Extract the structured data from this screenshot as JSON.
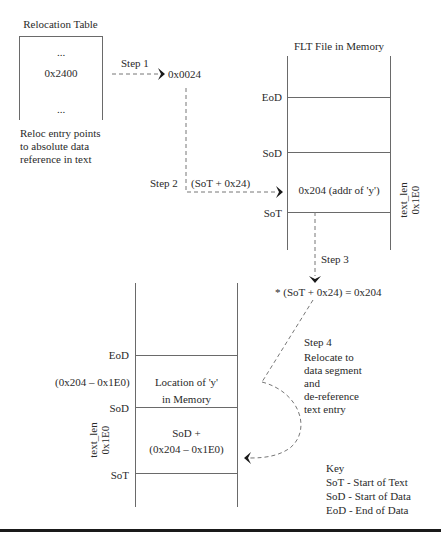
{
  "relocation_table": {
    "title": "Relocation Table",
    "entries": [
      "...",
      "0x2400",
      "..."
    ],
    "caption_lines": [
      "Reloc entry points",
      "to absolute data",
      "reference in text"
    ]
  },
  "steps": {
    "step1": {
      "label": "Step 1",
      "target": "0x0024"
    },
    "step2": {
      "label": "Step 2",
      "expr": "(SoT + 0x24)"
    },
    "step3": {
      "label": "Step 3",
      "result": "* (SoT + 0x24) = 0x204"
    },
    "step4": {
      "label": "Step 4",
      "desc_lines": [
        "Relocate to",
        "data segment",
        "and",
        "de-reference",
        "text entry"
      ]
    }
  },
  "flt_file": {
    "title": "FLT File in Memory",
    "markers": {
      "eod": "EoD",
      "sod": "SoD",
      "sot": "SoT"
    },
    "text_entry": "0x204 (addr of 'y')",
    "side_label_lines": [
      "text_len",
      "0x1E0"
    ]
  },
  "memory": {
    "markers": {
      "eod": "EoD",
      "sod": "SoD",
      "sot": "SoT"
    },
    "offset_label": "(0x204 – 0x1E0)",
    "data_cell_lines": [
      "Location of 'y'",
      "in Memory"
    ],
    "text_cell_lines": [
      "SoD +",
      "(0x204 – 0x1E0)"
    ],
    "side_label_lines": [
      "text_len",
      "0x1E0"
    ]
  },
  "key": {
    "title": "Key",
    "items": [
      "SoT - Start of Text",
      "SoD - Start of Data",
      "EoD - End of Data"
    ]
  }
}
